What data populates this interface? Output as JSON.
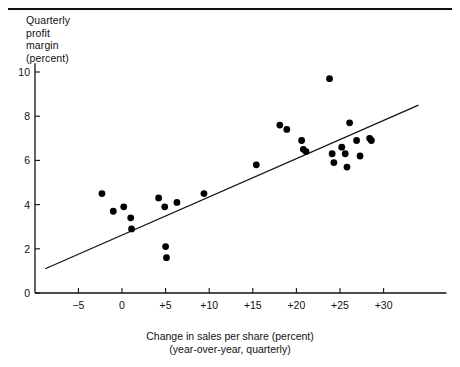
{
  "figure": {
    "top_rule": true,
    "axis_color": "#111111",
    "point_color": "#000000",
    "line_color": "#111111"
  },
  "chart_data": {
    "type": "scatter",
    "title": "",
    "ylabel": "Quarterly\nprofit\nmargin\n(percent)",
    "xlabel": "Change in sales per share (percent)",
    "xlabel_sub": "(year-over-year, quarterly)",
    "xlim": [
      -8.8,
      34.0
    ],
    "ylim": [
      0,
      10.4
    ],
    "xticks": [
      -5,
      0,
      5,
      10,
      15,
      20,
      25,
      30
    ],
    "xticklabels": [
      "−5",
      "0",
      "+5",
      "+10",
      "+15",
      "+20",
      "+25",
      "+30"
    ],
    "yticks": [
      0,
      2,
      4,
      6,
      8,
      10
    ],
    "yticklabels": [
      "0",
      "2",
      "4",
      "6",
      "8",
      "10"
    ],
    "grid": false,
    "legend": "none",
    "points": [
      {
        "x": -2.3,
        "y": 4.5
      },
      {
        "x": -1.0,
        "y": 3.7
      },
      {
        "x": 0.2,
        "y": 3.9
      },
      {
        "x": 1.0,
        "y": 3.4
      },
      {
        "x": 1.1,
        "y": 2.9
      },
      {
        "x": 4.2,
        "y": 4.3
      },
      {
        "x": 4.9,
        "y": 3.9
      },
      {
        "x": 5.0,
        "y": 2.1
      },
      {
        "x": 5.1,
        "y": 1.6
      },
      {
        "x": 6.3,
        "y": 4.1
      },
      {
        "x": 9.4,
        "y": 4.5
      },
      {
        "x": 15.4,
        "y": 5.8
      },
      {
        "x": 18.1,
        "y": 7.6
      },
      {
        "x": 18.9,
        "y": 7.4
      },
      {
        "x": 20.6,
        "y": 6.9
      },
      {
        "x": 20.8,
        "y": 6.5
      },
      {
        "x": 21.1,
        "y": 6.4
      },
      {
        "x": 23.8,
        "y": 9.7
      },
      {
        "x": 24.1,
        "y": 6.3
      },
      {
        "x": 24.3,
        "y": 5.9
      },
      {
        "x": 25.2,
        "y": 6.6
      },
      {
        "x": 25.6,
        "y": 6.3
      },
      {
        "x": 25.8,
        "y": 5.7
      },
      {
        "x": 26.1,
        "y": 7.7
      },
      {
        "x": 26.9,
        "y": 6.9
      },
      {
        "x": 27.3,
        "y": 6.2
      },
      {
        "x": 28.4,
        "y": 7.0
      },
      {
        "x": 28.6,
        "y": 6.9
      }
    ],
    "trendline": {
      "x1": -8.8,
      "y1": 1.1,
      "x2": 34.0,
      "y2": 8.5
    }
  }
}
